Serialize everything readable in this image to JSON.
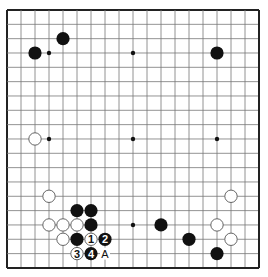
{
  "board": {
    "size": 19,
    "background": "#ffffff",
    "line_color": "#777777",
    "border_color": "#222222",
    "black_color": "#111111",
    "white_fill": "#ffffff",
    "white_stroke": "#555555",
    "star_points": [
      [
        3,
        3
      ],
      [
        9,
        3
      ],
      [
        15,
        3
      ],
      [
        3,
        9
      ],
      [
        9,
        9
      ],
      [
        15,
        9
      ],
      [
        3,
        15
      ],
      [
        9,
        15
      ],
      [
        15,
        15
      ]
    ]
  },
  "stones": [
    {
      "color": "black",
      "col": 2,
      "row": 3
    },
    {
      "color": "black",
      "col": 4,
      "row": 2
    },
    {
      "color": "black",
      "col": 15,
      "row": 3
    },
    {
      "color": "white",
      "col": 2,
      "row": 9
    },
    {
      "color": "white",
      "col": 3,
      "row": 13
    },
    {
      "color": "black",
      "col": 5,
      "row": 14
    },
    {
      "color": "black",
      "col": 6,
      "row": 14
    },
    {
      "color": "white",
      "col": 3,
      "row": 15
    },
    {
      "color": "white",
      "col": 4,
      "row": 15
    },
    {
      "color": "white",
      "col": 5,
      "row": 15
    },
    {
      "color": "black",
      "col": 6,
      "row": 15
    },
    {
      "color": "white",
      "col": 4,
      "row": 16
    },
    {
      "color": "black",
      "col": 5,
      "row": 16
    },
    {
      "color": "white",
      "col": 6,
      "row": 16,
      "label": "1"
    },
    {
      "color": "black",
      "col": 7,
      "row": 16,
      "label": "2"
    },
    {
      "color": "white",
      "col": 5,
      "row": 17,
      "label": "3"
    },
    {
      "color": "black",
      "col": 6,
      "row": 17,
      "label": "4"
    },
    {
      "color": "black",
      "col": 11,
      "row": 15
    },
    {
      "color": "black",
      "col": 13,
      "row": 16
    },
    {
      "color": "black",
      "col": 15,
      "row": 17
    },
    {
      "color": "white",
      "col": 16,
      "row": 13
    },
    {
      "color": "white",
      "col": 15,
      "row": 15
    },
    {
      "color": "white",
      "col": 16,
      "row": 16
    }
  ],
  "markers": [
    {
      "text": "A",
      "col": 7,
      "row": 17
    }
  ]
}
